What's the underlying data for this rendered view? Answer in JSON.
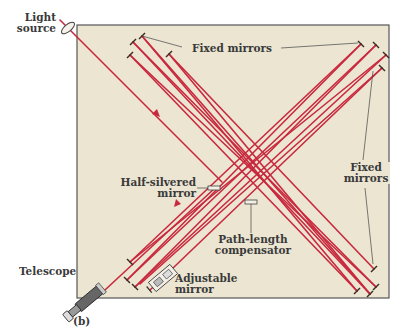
{
  "figure": {
    "panel_label": "(b)",
    "colors": {
      "background": "#ffffff",
      "box_fill": "#ebe5d2",
      "box_border": "#555555",
      "beam": "#c9293e",
      "label_text": "#3a3a3a",
      "leader_line": "#444444"
    },
    "labels": {
      "light_source_line1": "Light",
      "light_source_line2": "source",
      "fixed_mirrors_top": "Fixed mirrors",
      "half_silvered_line1": "Half-silvered",
      "half_silvered_line2": "mirror",
      "fixed_mirrors_right_line1": "Fixed",
      "fixed_mirrors_right_line2": "mirrors",
      "path_length_line1": "Path-length",
      "path_length_line2": "compensator",
      "telescope": "Telescope",
      "adjustable_line1": "Adjustable",
      "adjustable_line2": "mirror"
    },
    "components": [
      {
        "name": "light-source",
        "type": "lens"
      },
      {
        "name": "half-silvered-mirror",
        "type": "beam-splitter"
      },
      {
        "name": "path-length-compensator",
        "type": "plate"
      },
      {
        "name": "fixed-mirrors",
        "type": "mirror",
        "count": 8
      },
      {
        "name": "adjustable-mirror",
        "type": "mirror"
      },
      {
        "name": "telescope",
        "type": "detector"
      }
    ]
  }
}
